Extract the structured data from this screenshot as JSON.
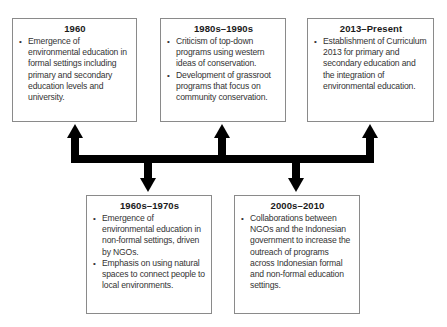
{
  "diagram": {
    "type": "timeline",
    "colors": {
      "arrow": "#000000",
      "box_border": "#8a8a8a",
      "text": "#333333"
    },
    "top_boxes": [
      {
        "period": "1960",
        "bullets": [
          "Emergence of environmental education in formal settings including primary and secondary education levels and university."
        ]
      },
      {
        "period": "1980s–1990s",
        "bullets": [
          "Criticism of top-down programs using western ideas  of conservation.",
          "Development of grassroot programs that focus on community conservation."
        ]
      },
      {
        "period": "2013–Present",
        "bullets": [
          "Establishment of Curriculum 2013 for primary and secondary education and the integration of environmental education."
        ]
      }
    ],
    "bottom_boxes": [
      {
        "period": "1960s–1970s",
        "bullets": [
          "Emergence of environmental education in non-formal settings, driven by NGOs.",
          "Emphasis on using natural spaces to connect people to local environments."
        ]
      },
      {
        "period": "2000s–2010",
        "bullets": [
          "Collaborations between NGOs and the Indonesian government to increase the outreach of programs across Indonesian formal and non-formal education settings."
        ]
      }
    ],
    "connector": {
      "icon": "timeline-arrows",
      "up_arrows": 3,
      "down_arrows": 2
    }
  }
}
